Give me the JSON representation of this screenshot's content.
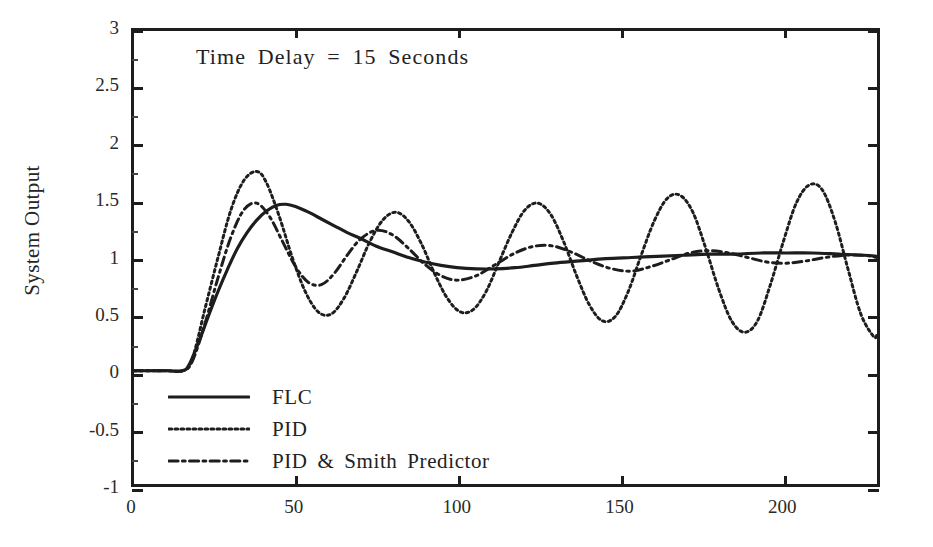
{
  "chart_data": {
    "type": "line",
    "title": "",
    "annotation": "Time Delay  =  15  Seconds",
    "xlabel": "",
    "ylabel": "System Output",
    "xlim": [
      0,
      230
    ],
    "ylim": [
      -1,
      3
    ],
    "xticks": [
      0,
      50,
      100,
      150,
      200
    ],
    "yticks": [
      -1,
      -0.5,
      0,
      0.5,
      1,
      1.5,
      2,
      2.5,
      3
    ],
    "xtick_labels": [
      "0",
      "50",
      "100",
      "150",
      "200"
    ],
    "ytick_labels": [
      "-1",
      "-0.5",
      "0",
      "0.5",
      "1",
      "1.5",
      "2",
      "2.5",
      "3"
    ],
    "grid": false,
    "legend_position": "lower-left-inside",
    "time_delay_seconds": 15,
    "series": [
      {
        "name": "FLC",
        "style": "solid",
        "color": "#1d1d1d",
        "x": [
          0,
          5,
          10,
          15,
          17,
          20,
          23,
          26,
          29,
          32,
          35,
          38,
          41,
          44,
          47,
          50,
          54,
          58,
          62,
          66,
          70,
          75,
          80,
          85,
          90,
          95,
          100,
          106,
          112,
          118,
          124,
          130,
          138,
          146,
          154,
          162,
          170,
          178,
          186,
          194,
          202,
          210,
          218,
          226,
          230
        ],
        "y": [
          0,
          0,
          0,
          0,
          0.05,
          0.25,
          0.48,
          0.7,
          0.9,
          1.08,
          1.22,
          1.33,
          1.41,
          1.46,
          1.47,
          1.45,
          1.4,
          1.34,
          1.28,
          1.22,
          1.17,
          1.1,
          1.05,
          1.0,
          0.96,
          0.93,
          0.91,
          0.9,
          0.9,
          0.91,
          0.93,
          0.95,
          0.97,
          0.99,
          1.0,
          1.01,
          1.02,
          1.03,
          1.03,
          1.04,
          1.04,
          1.04,
          1.03,
          1.02,
          1.01
        ]
      },
      {
        "name": "PID",
        "style": "dotted",
        "color": "#1d1d1d",
        "x": [
          0,
          10,
          15,
          18,
          22,
          26,
          30,
          34,
          38,
          41,
          45,
          49,
          53,
          57,
          61,
          65,
          69,
          73,
          77,
          81,
          85,
          89,
          93,
          97,
          101,
          105,
          109,
          113,
          117,
          121,
          125,
          129,
          133,
          137,
          141,
          145,
          149,
          153,
          157,
          161,
          165,
          169,
          173,
          177,
          181,
          185,
          189,
          193,
          197,
          201,
          205,
          209,
          213,
          217,
          221,
          225,
          229,
          230
        ],
        "y": [
          0,
          0,
          0,
          0.1,
          0.55,
          1.0,
          1.42,
          1.68,
          1.76,
          1.66,
          1.36,
          1.0,
          0.7,
          0.52,
          0.5,
          0.64,
          0.88,
          1.14,
          1.33,
          1.4,
          1.32,
          1.12,
          0.86,
          0.64,
          0.52,
          0.54,
          0.7,
          0.96,
          1.22,
          1.42,
          1.48,
          1.38,
          1.14,
          0.84,
          0.58,
          0.44,
          0.48,
          0.7,
          1.02,
          1.32,
          1.52,
          1.55,
          1.4,
          1.08,
          0.72,
          0.44,
          0.34,
          0.44,
          0.76,
          1.14,
          1.48,
          1.64,
          1.6,
          1.32,
          0.9,
          0.5,
          0.3,
          0.32
        ]
      },
      {
        "name": "PID & Smith Predictor",
        "style": "dashed",
        "color": "#1d1d1d",
        "x": [
          0,
          10,
          15,
          18,
          22,
          26,
          30,
          34,
          38,
          42,
          46,
          50,
          54,
          58,
          62,
          66,
          70,
          75,
          80,
          85,
          90,
          95,
          100,
          106,
          112,
          118,
          124,
          130,
          136,
          142,
          148,
          154,
          160,
          166,
          172,
          178,
          184,
          190,
          196,
          202,
          208,
          214,
          220,
          226,
          230
        ],
        "y": [
          0,
          0,
          0,
          0.08,
          0.42,
          0.82,
          1.18,
          1.42,
          1.48,
          1.36,
          1.14,
          0.92,
          0.78,
          0.76,
          0.86,
          1.02,
          1.16,
          1.24,
          1.2,
          1.08,
          0.94,
          0.84,
          0.8,
          0.84,
          0.94,
          1.04,
          1.1,
          1.1,
          1.04,
          0.96,
          0.9,
          0.88,
          0.92,
          0.98,
          1.04,
          1.06,
          1.04,
          1.0,
          0.96,
          0.95,
          0.97,
          1.0,
          1.02,
          1.02,
          1.0
        ]
      }
    ],
    "legend": [
      {
        "label": "FLC",
        "style": "solid"
      },
      {
        "label": "PID",
        "style": "dotted"
      },
      {
        "label": "PID  &  Smith  Predictor",
        "style": "dashed"
      }
    ]
  }
}
